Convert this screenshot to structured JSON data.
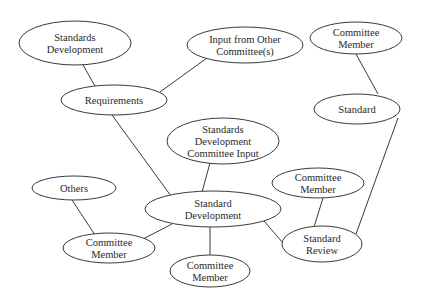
{
  "diagram": {
    "type": "concept-map",
    "nodes": [
      {
        "id": "standards_development",
        "lines": [
          "Standards",
          "Development"
        ],
        "cx": 75,
        "cy": 43,
        "rx": 56,
        "ry": 22
      },
      {
        "id": "input_other_committees",
        "lines": [
          "Input from Other",
          "Committee(s)"
        ],
        "cx": 245,
        "cy": 45,
        "rx": 58,
        "ry": 18
      },
      {
        "id": "committee_member_top",
        "lines": [
          "Committee",
          "Member"
        ],
        "cx": 356,
        "cy": 38,
        "rx": 46,
        "ry": 16
      },
      {
        "id": "requirements",
        "lines": [
          "Requirements"
        ],
        "cx": 114,
        "cy": 100,
        "rx": 53,
        "ry": 15
      },
      {
        "id": "standard",
        "lines": [
          "Standard"
        ],
        "cx": 357,
        "cy": 109,
        "rx": 43,
        "ry": 15
      },
      {
        "id": "sd_committee_input",
        "lines": [
          "Standards",
          "Development",
          "Committee Input"
        ],
        "cx": 223,
        "cy": 141,
        "rx": 56,
        "ry": 23
      },
      {
        "id": "others",
        "lines": [
          "Others"
        ],
        "cx": 74,
        "cy": 188,
        "rx": 42,
        "ry": 12
      },
      {
        "id": "standard_development",
        "lines": [
          "Standard",
          "Development"
        ],
        "cx": 213,
        "cy": 209,
        "rx": 68,
        "ry": 18
      },
      {
        "id": "committee_member_right",
        "lines": [
          "Committee",
          "Member"
        ],
        "cx": 318,
        "cy": 183,
        "rx": 46,
        "ry": 15
      },
      {
        "id": "committee_member_left",
        "lines": [
          "Committee",
          "Member"
        ],
        "cx": 109,
        "cy": 248,
        "rx": 46,
        "ry": 15
      },
      {
        "id": "standard_review",
        "lines": [
          "Standard",
          "Review"
        ],
        "cx": 322,
        "cy": 244,
        "rx": 40,
        "ry": 18
      },
      {
        "id": "committee_member_bottom",
        "lines": [
          "Committee",
          "Member"
        ],
        "cx": 210,
        "cy": 271,
        "rx": 40,
        "ry": 16
      }
    ],
    "edges": [
      {
        "from": "standards_development",
        "to": "requirements",
        "x1": 83,
        "y1": 65,
        "x2": 95,
        "y2": 86
      },
      {
        "from": "input_other_committees",
        "to": "requirements",
        "x1": 207,
        "y1": 58,
        "x2": 160,
        "y2": 92
      },
      {
        "from": "requirements",
        "to": "standard_development",
        "x1": 112,
        "y1": 115,
        "x2": 171,
        "y2": 196
      },
      {
        "from": "sd_committee_input",
        "to": "standard_development",
        "x1": 210,
        "y1": 163,
        "x2": 202,
        "y2": 192
      },
      {
        "from": "others",
        "to": "committee_member_left",
        "x1": 72,
        "y1": 200,
        "x2": 95,
        "y2": 235
      },
      {
        "from": "committee_member_left",
        "to": "standard_development",
        "x1": 143,
        "y1": 239,
        "x2": 172,
        "y2": 224
      },
      {
        "from": "standard_development",
        "to": "committee_member_bottom",
        "x1": 210,
        "y1": 227,
        "x2": 210,
        "y2": 255
      },
      {
        "from": "standard_development",
        "to": "standard_review",
        "x1": 264,
        "y1": 221,
        "x2": 283,
        "y2": 243
      },
      {
        "from": "committee_member_right",
        "to": "standard_review",
        "x1": 323,
        "y1": 198,
        "x2": 314,
        "y2": 227
      },
      {
        "from": "committee_member_top",
        "to": "standard",
        "x1": 356,
        "y1": 54,
        "x2": 378,
        "y2": 94
      },
      {
        "from": "standard",
        "to": "standard_review",
        "x1": 398,
        "y1": 118,
        "x2": 356,
        "y2": 234
      }
    ]
  },
  "colors": {
    "stroke": "#3a3a3a",
    "text": "#2a2a2a",
    "background": "#ffffff"
  }
}
